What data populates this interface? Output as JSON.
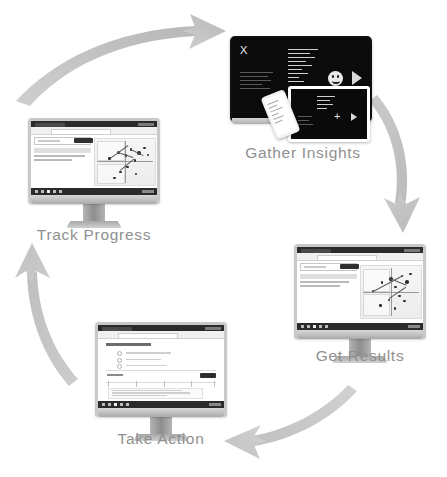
{
  "diagram": {
    "type": "cycle",
    "title": "",
    "stage_count": 4,
    "background_color": "#ffffff",
    "arrow_color": "#c7c7c7",
    "label_color": "#8f8f8f",
    "stages": [
      {
        "id": "gather-insights",
        "label": "Gather Insights",
        "order": 1,
        "device": "laptop-tablet-phone",
        "screen_theme": "dark",
        "screen_elements": [
          "x-logo",
          "text-lines",
          "smiley-face-icon",
          "play-icon",
          "plus-icon"
        ]
      },
      {
        "id": "get-results",
        "label": "Get Results",
        "order": 2,
        "device": "desktop-monitor",
        "screen_theme": "light",
        "screen_elements": [
          "browser-window",
          "search-panel",
          "scatter-chart"
        ]
      },
      {
        "id": "take-action",
        "label": "Take Action",
        "order": 3,
        "device": "desktop-monitor",
        "screen_theme": "light",
        "screen_elements": [
          "browser-window",
          "form-page",
          "submit-button"
        ]
      },
      {
        "id": "track-progress",
        "label": "Track Progress",
        "order": 4,
        "device": "desktop-monitor",
        "screen_theme": "light",
        "screen_elements": [
          "browser-window",
          "search-panel",
          "network-chart"
        ]
      }
    ],
    "arrows": [
      {
        "id": "arrow-track-to-gather",
        "from": "track-progress",
        "to": "gather-insights",
        "direction": "up-right"
      },
      {
        "id": "arrow-gather-to-results",
        "from": "gather-insights",
        "to": "get-results",
        "direction": "down"
      },
      {
        "id": "arrow-results-to-action",
        "from": "get-results",
        "to": "take-action",
        "direction": "left"
      },
      {
        "id": "arrow-action-to-track",
        "from": "take-action",
        "to": "track-progress",
        "direction": "up"
      }
    ]
  },
  "gather_insights_screen": {
    "logo_text": "X",
    "play_icon": "play-icon",
    "face_icon": "smiley-face-icon",
    "plus_icon": "+"
  }
}
